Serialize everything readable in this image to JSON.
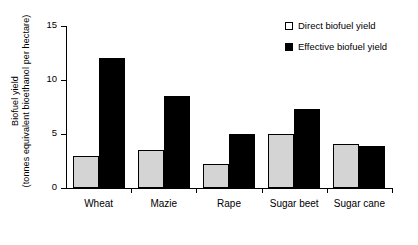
{
  "chart_data": {
    "type": "bar",
    "title": "",
    "xlabel": "",
    "ylabel": "Biofuel yield (tonnes equivalent bioethanol per hectare)",
    "ylabel_lines": [
      "Biofuel yield",
      "(tonnes equivalent bioethanol per hectare)"
    ],
    "categories": [
      "Wheat",
      "Mazie",
      "Rape",
      "Sugar beet",
      "Sugar cane"
    ],
    "series": [
      {
        "name": "Direct biofuel yield",
        "color": "#d4d4d4",
        "values": [
          3.0,
          3.5,
          2.2,
          5.0,
          4.1
        ]
      },
      {
        "name": "Effective biofuel yield",
        "color": "#000000",
        "values": [
          12.0,
          8.5,
          5.0,
          7.3,
          3.9
        ]
      }
    ],
    "ylim": [
      0,
      15
    ],
    "yticks": [
      0,
      5,
      10,
      15
    ],
    "ytick_labels": [
      "0",
      "5",
      "10",
      "15"
    ],
    "grid": false,
    "legend_position": "top-right"
  },
  "legend": {
    "items": [
      {
        "label": "Direct biofuel yield",
        "swatch": "open-square-icon"
      },
      {
        "label": "Effective biofuel yield",
        "swatch": "filled-square-icon"
      }
    ]
  }
}
